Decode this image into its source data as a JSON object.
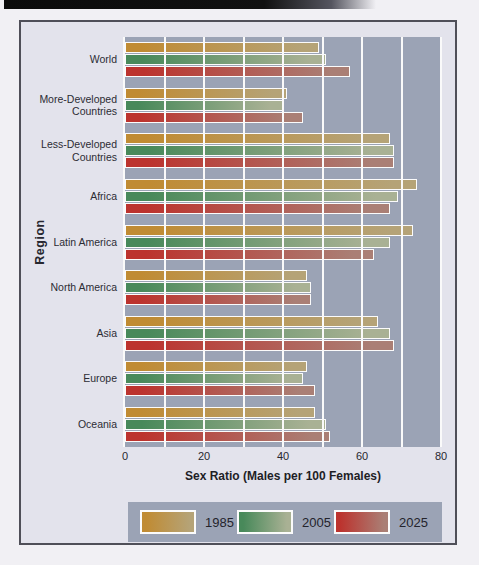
{
  "page": {
    "background_color": "#f1f0f4",
    "card_background_color": "#e3e3ec",
    "card_border_color": "#4f4f58",
    "scan_strip_color": "#0b0b0b"
  },
  "chart_data": {
    "type": "bar",
    "orientation": "horizontal",
    "title": "",
    "xlabel": "Sex Ratio (Males per 100 Females)",
    "ylabel": "Region",
    "xlim": [
      0,
      80
    ],
    "x_ticks": [
      0,
      20,
      40,
      60,
      80
    ],
    "gridline_step": 10,
    "grid": "on",
    "plot_background_color": "#9ba3b5",
    "gridline_color": "#fafafa",
    "legend_position": "bottom",
    "legend_background_color": "#9ba3b5",
    "categories": [
      "World",
      "More-Developed Countries",
      "Less-Developed Countries",
      "Africa",
      "Latin America",
      "North America",
      "Asia",
      "Europe",
      "Oceania"
    ],
    "series": [
      {
        "name": "1985",
        "color_start": "#c08b33",
        "color_end": "#b5a377",
        "values": [
          49,
          41,
          67,
          74,
          73,
          46,
          64,
          46,
          48
        ]
      },
      {
        "name": "2005",
        "color_start": "#48895a",
        "color_end": "#a9b194",
        "values": [
          51,
          40,
          68,
          69,
          67,
          47,
          67,
          45,
          51
        ]
      },
      {
        "name": "2025",
        "color_start": "#bc332e",
        "color_end": "#aa7f75",
        "values": [
          57,
          45,
          68,
          67,
          63,
          47,
          68,
          48,
          52
        ]
      }
    ]
  }
}
